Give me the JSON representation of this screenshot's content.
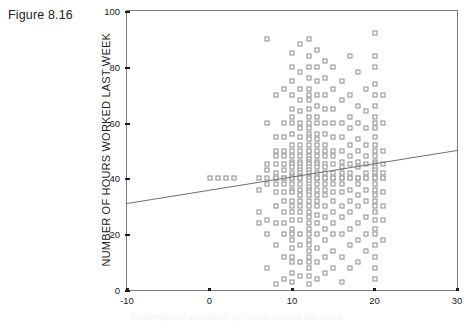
{
  "figure": {
    "title": "Figure 8.16",
    "caption_partial": "Scatterplot of education by hours worked last week"
  },
  "axis_colors": {
    "frame": "#7c7c7c",
    "marker_stroke": "#8a8a8a",
    "line": "#6f6f6f",
    "text": "#1a1a1a"
  },
  "chart_data": {
    "type": "scatter",
    "title": "Figure 8.16",
    "xlabel": "",
    "ylabel": "NUMBER OF HOURS WORKED LAST WEEK",
    "xlim": [
      -10,
      30
    ],
    "ylim": [
      0,
      100
    ],
    "xticks": [
      -10,
      0,
      10,
      20,
      30
    ],
    "yticks": [
      0,
      20,
      40,
      60,
      80,
      100
    ],
    "grid": false,
    "legend": null,
    "marker": "open-square",
    "fit_line": {
      "type": "linear-regression",
      "x": [
        -10,
        30
      ],
      "y": [
        31,
        50
      ],
      "slope": 0.475,
      "intercept": 35.75
    },
    "points": [
      [
        0,
        40
      ],
      [
        1,
        40
      ],
      [
        2,
        40
      ],
      [
        3,
        40
      ],
      [
        6,
        40
      ],
      [
        6,
        36
      ],
      [
        6,
        28
      ],
      [
        6,
        24
      ],
      [
        7,
        90
      ],
      [
        7,
        60
      ],
      [
        7,
        45
      ],
      [
        7,
        43
      ],
      [
        7,
        40
      ],
      [
        7,
        38
      ],
      [
        7,
        25
      ],
      [
        7,
        20
      ],
      [
        7,
        8
      ],
      [
        8,
        70
      ],
      [
        8,
        55
      ],
      [
        8,
        50
      ],
      [
        8,
        48
      ],
      [
        8,
        45
      ],
      [
        8,
        42
      ],
      [
        8,
        40
      ],
      [
        8,
        40
      ],
      [
        8,
        38
      ],
      [
        8,
        35
      ],
      [
        8,
        30
      ],
      [
        8,
        24
      ],
      [
        8,
        16
      ],
      [
        8,
        2
      ],
      [
        9,
        72
      ],
      [
        9,
        60
      ],
      [
        9,
        55
      ],
      [
        9,
        50
      ],
      [
        9,
        48
      ],
      [
        9,
        45
      ],
      [
        9,
        43
      ],
      [
        9,
        40
      ],
      [
        9,
        40
      ],
      [
        9,
        40
      ],
      [
        9,
        38
      ],
      [
        9,
        35
      ],
      [
        9,
        32
      ],
      [
        9,
        28
      ],
      [
        9,
        24
      ],
      [
        9,
        20
      ],
      [
        9,
        12
      ],
      [
        9,
        4
      ],
      [
        10,
        85
      ],
      [
        10,
        80
      ],
      [
        10,
        75
      ],
      [
        10,
        70
      ],
      [
        10,
        65
      ],
      [
        10,
        62
      ],
      [
        10,
        60
      ],
      [
        10,
        56
      ],
      [
        10,
        52
      ],
      [
        10,
        50
      ],
      [
        10,
        48
      ],
      [
        10,
        46
      ],
      [
        10,
        45
      ],
      [
        10,
        44
      ],
      [
        10,
        42
      ],
      [
        10,
        41
      ],
      [
        10,
        40
      ],
      [
        10,
        40
      ],
      [
        10,
        40
      ],
      [
        10,
        40
      ],
      [
        10,
        40
      ],
      [
        10,
        38
      ],
      [
        10,
        36
      ],
      [
        10,
        35
      ],
      [
        10,
        32
      ],
      [
        10,
        30
      ],
      [
        10,
        28
      ],
      [
        10,
        25
      ],
      [
        10,
        22
      ],
      [
        10,
        20
      ],
      [
        10,
        18
      ],
      [
        10,
        15
      ],
      [
        10,
        12
      ],
      [
        10,
        10
      ],
      [
        10,
        6
      ],
      [
        10,
        3
      ],
      [
        11,
        88
      ],
      [
        11,
        78
      ],
      [
        11,
        72
      ],
      [
        11,
        68
      ],
      [
        11,
        64
      ],
      [
        11,
        60
      ],
      [
        11,
        58
      ],
      [
        11,
        55
      ],
      [
        11,
        52
      ],
      [
        11,
        50
      ],
      [
        11,
        48
      ],
      [
        11,
        46
      ],
      [
        11,
        45
      ],
      [
        11,
        44
      ],
      [
        11,
        43
      ],
      [
        11,
        42
      ],
      [
        11,
        41
      ],
      [
        11,
        40
      ],
      [
        11,
        40
      ],
      [
        11,
        40
      ],
      [
        11,
        40
      ],
      [
        11,
        38
      ],
      [
        11,
        36
      ],
      [
        11,
        34
      ],
      [
        11,
        32
      ],
      [
        11,
        30
      ],
      [
        11,
        28
      ],
      [
        11,
        25
      ],
      [
        11,
        20
      ],
      [
        11,
        16
      ],
      [
        11,
        10
      ],
      [
        11,
        5
      ],
      [
        12,
        90
      ],
      [
        12,
        84
      ],
      [
        12,
        80
      ],
      [
        12,
        76
      ],
      [
        12,
        72
      ],
      [
        12,
        70
      ],
      [
        12,
        68
      ],
      [
        12,
        65
      ],
      [
        12,
        62
      ],
      [
        12,
        60
      ],
      [
        12,
        58
      ],
      [
        12,
        56
      ],
      [
        12,
        55
      ],
      [
        12,
        54
      ],
      [
        12,
        52
      ],
      [
        12,
        50
      ],
      [
        12,
        50
      ],
      [
        12,
        48
      ],
      [
        12,
        47
      ],
      [
        12,
        46
      ],
      [
        12,
        45
      ],
      [
        12,
        45
      ],
      [
        12,
        44
      ],
      [
        12,
        43
      ],
      [
        12,
        42
      ],
      [
        12,
        41
      ],
      [
        12,
        40
      ],
      [
        12,
        40
      ],
      [
        12,
        40
      ],
      [
        12,
        40
      ],
      [
        12,
        40
      ],
      [
        12,
        40
      ],
      [
        12,
        39
      ],
      [
        12,
        38
      ],
      [
        12,
        37
      ],
      [
        12,
        36
      ],
      [
        12,
        35
      ],
      [
        12,
        34
      ],
      [
        12,
        32
      ],
      [
        12,
        30
      ],
      [
        12,
        28
      ],
      [
        12,
        26
      ],
      [
        12,
        24
      ],
      [
        12,
        22
      ],
      [
        12,
        20
      ],
      [
        12,
        18
      ],
      [
        12,
        16
      ],
      [
        12,
        14
      ],
      [
        12,
        12
      ],
      [
        12,
        10
      ],
      [
        12,
        8
      ],
      [
        12,
        5
      ],
      [
        12,
        2
      ],
      [
        13,
        86
      ],
      [
        13,
        80
      ],
      [
        13,
        75
      ],
      [
        13,
        70
      ],
      [
        13,
        66
      ],
      [
        13,
        62
      ],
      [
        13,
        60
      ],
      [
        13,
        56
      ],
      [
        13,
        54
      ],
      [
        13,
        52
      ],
      [
        13,
        50
      ],
      [
        13,
        48
      ],
      [
        13,
        46
      ],
      [
        13,
        45
      ],
      [
        13,
        44
      ],
      [
        13,
        42
      ],
      [
        13,
        40
      ],
      [
        13,
        40
      ],
      [
        13,
        40
      ],
      [
        13,
        40
      ],
      [
        13,
        38
      ],
      [
        13,
        36
      ],
      [
        13,
        34
      ],
      [
        13,
        32
      ],
      [
        13,
        30
      ],
      [
        13,
        27
      ],
      [
        13,
        24
      ],
      [
        13,
        20
      ],
      [
        13,
        15
      ],
      [
        13,
        10
      ],
      [
        13,
        4
      ],
      [
        14,
        82
      ],
      [
        14,
        76
      ],
      [
        14,
        70
      ],
      [
        14,
        65
      ],
      [
        14,
        60
      ],
      [
        14,
        56
      ],
      [
        14,
        52
      ],
      [
        14,
        50
      ],
      [
        14,
        48
      ],
      [
        14,
        45
      ],
      [
        14,
        44
      ],
      [
        14,
        42
      ],
      [
        14,
        40
      ],
      [
        14,
        40
      ],
      [
        14,
        40
      ],
      [
        14,
        38
      ],
      [
        14,
        36
      ],
      [
        14,
        34
      ],
      [
        14,
        30
      ],
      [
        14,
        26
      ],
      [
        14,
        22
      ],
      [
        14,
        18
      ],
      [
        14,
        12
      ],
      [
        14,
        6
      ],
      [
        15,
        80
      ],
      [
        15,
        72
      ],
      [
        15,
        65
      ],
      [
        15,
        60
      ],
      [
        15,
        55
      ],
      [
        15,
        50
      ],
      [
        15,
        48
      ],
      [
        15,
        45
      ],
      [
        15,
        42
      ],
      [
        15,
        40
      ],
      [
        15,
        40
      ],
      [
        15,
        40
      ],
      [
        15,
        38
      ],
      [
        15,
        35
      ],
      [
        15,
        32
      ],
      [
        15,
        28
      ],
      [
        15,
        24
      ],
      [
        15,
        20
      ],
      [
        15,
        14
      ],
      [
        15,
        8
      ],
      [
        16,
        75
      ],
      [
        16,
        68
      ],
      [
        16,
        60
      ],
      [
        16,
        55
      ],
      [
        16,
        50
      ],
      [
        16,
        46
      ],
      [
        16,
        44
      ],
      [
        16,
        42
      ],
      [
        16,
        40
      ],
      [
        16,
        40
      ],
      [
        16,
        38
      ],
      [
        16,
        35
      ],
      [
        16,
        30
      ],
      [
        16,
        26
      ],
      [
        16,
        20
      ],
      [
        16,
        12
      ],
      [
        16,
        3
      ],
      [
        17,
        84
      ],
      [
        17,
        70
      ],
      [
        17,
        62
      ],
      [
        17,
        58
      ],
      [
        17,
        52
      ],
      [
        17,
        48
      ],
      [
        17,
        45
      ],
      [
        17,
        42
      ],
      [
        17,
        40
      ],
      [
        17,
        40
      ],
      [
        17,
        36
      ],
      [
        17,
        32
      ],
      [
        17,
        28
      ],
      [
        17,
        22
      ],
      [
        17,
        16
      ],
      [
        17,
        8
      ],
      [
        18,
        78
      ],
      [
        18,
        66
      ],
      [
        18,
        60
      ],
      [
        18,
        54
      ],
      [
        18,
        50
      ],
      [
        18,
        46
      ],
      [
        18,
        44
      ],
      [
        18,
        40
      ],
      [
        18,
        40
      ],
      [
        18,
        38
      ],
      [
        18,
        34
      ],
      [
        18,
        30
      ],
      [
        18,
        24
      ],
      [
        18,
        18
      ],
      [
        18,
        10
      ],
      [
        19,
        72
      ],
      [
        19,
        64
      ],
      [
        19,
        58
      ],
      [
        19,
        52
      ],
      [
        19,
        48
      ],
      [
        19,
        45
      ],
      [
        19,
        42
      ],
      [
        19,
        40
      ],
      [
        19,
        40
      ],
      [
        19,
        36
      ],
      [
        19,
        32
      ],
      [
        19,
        26
      ],
      [
        19,
        20
      ],
      [
        19,
        14
      ],
      [
        20,
        92
      ],
      [
        20,
        84
      ],
      [
        20,
        80
      ],
      [
        20,
        74
      ],
      [
        20,
        70
      ],
      [
        20,
        66
      ],
      [
        20,
        62
      ],
      [
        20,
        60
      ],
      [
        20,
        58
      ],
      [
        20,
        55
      ],
      [
        20,
        52
      ],
      [
        20,
        50
      ],
      [
        20,
        48
      ],
      [
        20,
        46
      ],
      [
        20,
        45
      ],
      [
        20,
        44
      ],
      [
        20,
        43
      ],
      [
        20,
        42
      ],
      [
        20,
        41
      ],
      [
        20,
        40
      ],
      [
        20,
        40
      ],
      [
        20,
        40
      ],
      [
        20,
        40
      ],
      [
        20,
        38
      ],
      [
        20,
        36
      ],
      [
        20,
        34
      ],
      [
        20,
        32
      ],
      [
        20,
        30
      ],
      [
        20,
        28
      ],
      [
        20,
        25
      ],
      [
        20,
        22
      ],
      [
        20,
        20
      ],
      [
        20,
        16
      ],
      [
        20,
        12
      ],
      [
        20,
        8
      ],
      [
        20,
        4
      ],
      [
        21,
        70
      ],
      [
        21,
        60
      ],
      [
        21,
        50
      ],
      [
        21,
        45
      ],
      [
        21,
        42
      ],
      [
        21,
        40
      ],
      [
        21,
        40
      ],
      [
        21,
        35
      ],
      [
        21,
        30
      ],
      [
        21,
        25
      ],
      [
        21,
        18
      ]
    ]
  }
}
